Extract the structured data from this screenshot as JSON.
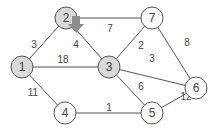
{
  "colors": {
    "visited_fill": "#d9d9d9",
    "unvisited_fill": "#ffffff",
    "arrow_fill": "#8c8c8c"
  },
  "nodes": [
    {
      "id": "1",
      "label": "1",
      "x": 22,
      "y": 67,
      "visited": true
    },
    {
      "id": "2",
      "label": "2",
      "x": 66,
      "y": 18,
      "visited": true
    },
    {
      "id": "3",
      "label": "3",
      "x": 109,
      "y": 67,
      "visited": true
    },
    {
      "id": "4",
      "label": "4",
      "x": 65,
      "y": 113,
      "visited": false
    },
    {
      "id": "5",
      "label": "5",
      "x": 152,
      "y": 113,
      "visited": false
    },
    {
      "id": "6",
      "label": "6",
      "x": 196,
      "y": 88,
      "visited": false
    },
    {
      "id": "7",
      "label": "7",
      "x": 152,
      "y": 18,
      "visited": false
    }
  ],
  "edges": [
    {
      "from": "1",
      "to": "2",
      "weight": "3",
      "lx": 34,
      "ly": 44
    },
    {
      "from": "1",
      "to": "3",
      "weight": "18",
      "lx": 63,
      "ly": 59
    },
    {
      "from": "1",
      "to": "4",
      "weight": "11",
      "lx": 33,
      "ly": 92
    },
    {
      "from": "2",
      "to": "3",
      "weight": "4",
      "lx": 76,
      "ly": 44
    },
    {
      "from": "2",
      "to": "7",
      "weight": "7",
      "lx": 110,
      "ly": 28
    },
    {
      "from": "3",
      "to": "7",
      "weight": "2",
      "lx": 141,
      "ly": 45
    },
    {
      "from": "3",
      "to": "6",
      "weight": "3",
      "lx": 152,
      "ly": 58
    },
    {
      "from": "3",
      "to": "5",
      "weight": "6",
      "lx": 141,
      "ly": 86
    },
    {
      "from": "4",
      "to": "5",
      "weight": "1",
      "lx": 109,
      "ly": 107
    },
    {
      "from": "5",
      "to": "6",
      "weight": "12",
      "lx": 186,
      "ly": 96
    },
    {
      "from": "7",
      "to": "6",
      "weight": "8",
      "lx": 187,
      "ly": 42
    }
  ],
  "arrow": {
    "at_node": "2",
    "direction": "down",
    "x": 76,
    "y": 26
  }
}
